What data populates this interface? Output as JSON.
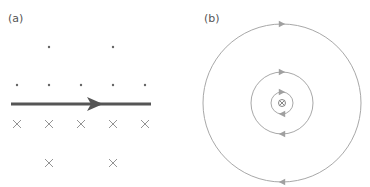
{
  "panel_a": {
    "label": "(a)",
    "field_above": "out-of-page (dots)",
    "field_below": "into-page (crosses)",
    "current_direction": "right"
  },
  "panel_b": {
    "label": "(b)",
    "center_symbol": "⊗",
    "current_direction": "into page",
    "field_lines": 3,
    "circulation": "clockwise"
  },
  "colors": {
    "wire": "#555555",
    "field_lines": "#a0a0a0",
    "symbols": "#777777",
    "label": "#555555"
  }
}
